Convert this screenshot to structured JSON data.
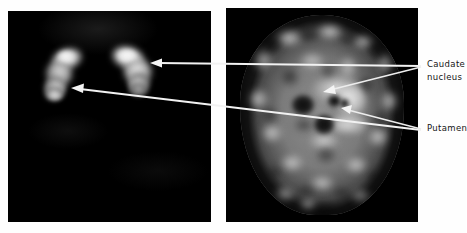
{
  "figure": {
    "title": "",
    "background_color": "#fefefe"
  },
  "panels": [
    {
      "id": "left-panel",
      "modality_name": "striatal-uptake-scan",
      "background_color": "#000000",
      "structures": [
        "left striatum",
        "right striatum"
      ]
    },
    {
      "id": "right-panel",
      "modality_name": "brain-slice-scan",
      "background_color": "#000000",
      "structures": [
        "cerebral cortex",
        "ventricles",
        "caudate nucleus",
        "putamen"
      ]
    }
  ],
  "annotations": [
    {
      "label_line_1": "Caudate",
      "label_line_2": "nucleus",
      "target_count": 2,
      "color": "#f2f2f2"
    },
    {
      "label_line_1": "Putamen",
      "label_line_2": "",
      "target_count": 2,
      "color": "#f2f2f2"
    }
  ],
  "labels": {
    "caudate_line1": "Caudate",
    "caudate_line2": "nucleus",
    "putamen": "Putamen"
  },
  "colors": {
    "panel_background": "#000000",
    "page_background": "#fefefe",
    "annotation_stroke": "#f2f2f2",
    "label_text": "#141414"
  }
}
